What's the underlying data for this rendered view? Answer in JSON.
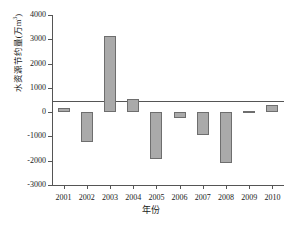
{
  "chart_data": {
    "type": "bar",
    "title": "",
    "xlabel": "年份",
    "ylabel": "水资源节约量(万m³)",
    "ylabel_main": "水资源节约量(万m",
    "ylabel_sup": "3",
    "ylabel_tail": ")",
    "categories": [
      "2001",
      "2002",
      "2003",
      "2004",
      "2005",
      "2006",
      "2007",
      "2008",
      "2009",
      "2010"
    ],
    "values": [
      180,
      -1250,
      3150,
      550,
      -1950,
      -250,
      -950,
      -2100,
      50,
      300
    ],
    "series": [
      {
        "name": "水资源节约量",
        "values": [
          180,
          -1250,
          3150,
          550,
          -1950,
          -250,
          -950,
          -2100,
          50,
          300
        ]
      }
    ],
    "ylim": [
      -3000,
      4000
    ],
    "yticks": [
      4000,
      3000,
      2000,
      1000,
      0,
      -1000,
      -2000,
      -3000
    ],
    "ytick_labels": [
      "4000",
      "3000",
      "2000",
      "1000",
      "0",
      "-1000",
      "-2000",
      "-3000"
    ],
    "grid": false,
    "legend": "none",
    "bar_color": "#aaaaaa",
    "bar_edge_color": "#6e6e6e",
    "axis_color": "#555555",
    "background": "#ffffff"
  }
}
